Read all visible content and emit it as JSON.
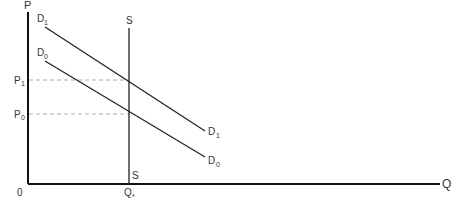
{
  "diagram": {
    "type": "supply-demand",
    "axes": {
      "y_label": "P",
      "x_label": "Q",
      "origin_label": "0"
    },
    "price_levels": [
      {
        "label": "P",
        "subscript": "1"
      },
      {
        "label": "P",
        "subscript": "0"
      }
    ],
    "quantity_levels": [
      {
        "label": "Q",
        "subscript": "*"
      }
    ],
    "curves": {
      "supply": {
        "top_label": "S",
        "bottom_label": "S",
        "kind": "vertical"
      },
      "demand_new": {
        "label": "D",
        "subscript": "1"
      },
      "demand_old": {
        "label": "D",
        "subscript": "0"
      }
    },
    "colors": {
      "axis": "#111111",
      "curve": "#222222",
      "guide": "#999999",
      "text": "#333333"
    }
  }
}
